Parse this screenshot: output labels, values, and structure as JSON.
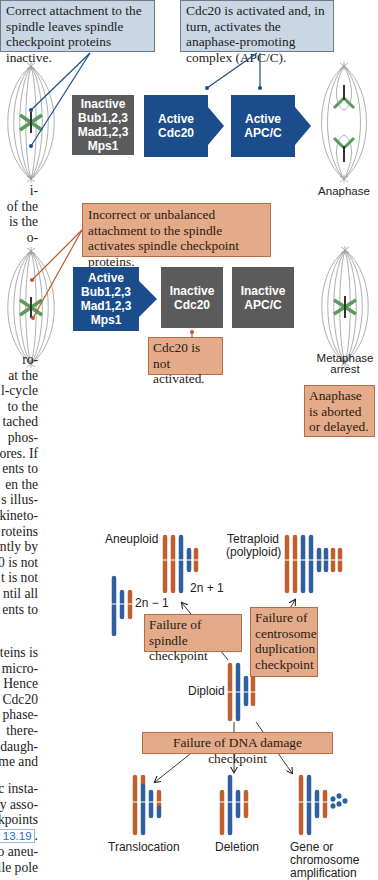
{
  "top_panel": {
    "callout_correct": "Correct attachment to the spindle leaves spindle checkpoint proteins inactive.",
    "callout_cdc20_activated": "Cdc20 is activated and, in turn, activates the anaphase-promoting complex (APC/C).",
    "box_inactive_bub": [
      "Inactive",
      "Bub1,2,3",
      "Mad1,2,3",
      "Mps1"
    ],
    "box_active_cdc20": [
      "Active",
      "Cdc20"
    ],
    "box_active_apcc": [
      "Active",
      "APC/C"
    ],
    "result_label": "Anaphase"
  },
  "middle_panel": {
    "callout_incorrect": "Incorrect or unbalanced attachment to the spindle activates spindle checkpoint proteins.",
    "box_active_bub": [
      "Active",
      "Bub1,2,3",
      "Mad1,2,3",
      "Mps1"
    ],
    "box_inactive_cdc20": [
      "Inactive",
      "Cdc20"
    ],
    "box_inactive_apcc": [
      "Inactive",
      "APC/C"
    ],
    "callout_cdc20_not": "Cdc20 is not activated.",
    "result_label": "Metaphase arrest",
    "callout_aborted": "Anaphase is aborted or delayed."
  },
  "bottom_panel": {
    "label_aneuploid": "Aneuploid",
    "label_2n_plus_1": "2n + 1",
    "label_2n_minus_1": "2n − 1",
    "label_tetraploid": "Tetraploid (polyploid)",
    "callout_spindle_failure": "Failure of spindle checkpoint",
    "callout_centrosome_failure": "Failure of centrosome duplication checkpoint",
    "label_diploid": "Diploid",
    "callout_dna_damage_failure": "Failure of DNA damage checkpoint",
    "label_translocation": "Translocation",
    "label_deletion": "Deletion",
    "label_amplification": "Gene or chromosome amplification"
  },
  "body_text_fragments": {
    "block1": [
      "i-",
      "of the",
      "is the",
      "o-"
    ],
    "block2": [
      "ro-",
      "at the",
      "l-cycle",
      "to the",
      "tached",
      "phos-",
      "ores. If",
      "ents to",
      "en the",
      "s illus-",
      "kineto-",
      "roteins",
      "ntly by",
      "0 is not",
      "t is not",
      "ntil all",
      "ents to"
    ],
    "block3": [
      "teins is",
      "micro-",
      "Hence",
      "Cdc20",
      "phase-",
      "there-",
      "daugh-",
      "me and"
    ],
    "block4": [
      "c insta-",
      "ty asso-",
      "kpoints"
    ],
    "figure_ref": "e 13.19",
    "block4_after": ".",
    "block5": [
      "o aneu-",
      "lle pole"
    ]
  },
  "colors": {
    "blue_box": "#1b4d8c",
    "gray_box": "#5b5b5b",
    "blue_callout": "#c9d6e3",
    "tan_callout": "#e3ab8a",
    "chromosome_orange": "#c0602e",
    "chromosome_blue": "#2f5f9e",
    "chromosome_green": "#5a9a5a"
  }
}
